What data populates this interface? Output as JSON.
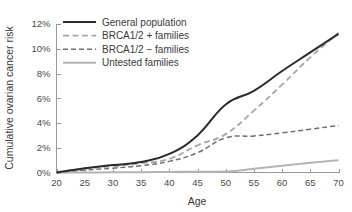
{
  "chart_data": {
    "type": "line",
    "title": "",
    "xlabel": "Age",
    "ylabel": "Cumulative ovarian cancer risk",
    "xlim": [
      20,
      70
    ],
    "ylim": [
      0,
      12
    ],
    "grid": false,
    "legend_position": "top-left-inside",
    "x_tick_labels": [
      "20",
      "25",
      "30",
      "35",
      "40",
      "45",
      "50",
      "55",
      "60",
      "65",
      "70"
    ],
    "x_ticks": [
      20,
      25,
      30,
      35,
      40,
      45,
      50,
      55,
      60,
      65,
      70
    ],
    "y_tick_labels": [
      "0%",
      "2%",
      "4%",
      "6%",
      "8%",
      "10%",
      "12%"
    ],
    "y_ticks": [
      0,
      2,
      4,
      6,
      8,
      10,
      12
    ],
    "x": [
      20,
      25,
      30,
      35,
      40,
      45,
      50,
      55,
      60,
      65,
      70
    ],
    "series": [
      {
        "name": "General population",
        "color": "#2b2b2b",
        "style": "solid",
        "width": 2.0,
        "values": [
          0.0,
          0.35,
          0.6,
          0.85,
          1.5,
          3.0,
          5.5,
          6.6,
          8.2,
          9.7,
          11.2
        ]
      },
      {
        "name": "BRCA1/2 + families",
        "color": "#a8a8a8",
        "style": "dashed",
        "width": 1.9,
        "values": [
          0.0,
          0.3,
          0.5,
          0.75,
          1.1,
          2.2,
          3.1,
          5.0,
          7.1,
          9.3,
          11.3
        ]
      },
      {
        "name": "BRCA1/2 − families",
        "color": "#6e6e6e",
        "style": "dashed",
        "width": 1.5,
        "values": [
          0.0,
          0.2,
          0.35,
          0.55,
          0.9,
          1.6,
          2.8,
          2.95,
          3.2,
          3.5,
          3.8
        ]
      },
      {
        "name": "Untested families",
        "color": "#b4b4b4",
        "style": "solid",
        "width": 2.0,
        "values": [
          0.0,
          0.0,
          0.02,
          0.03,
          0.05,
          0.06,
          0.08,
          0.3,
          0.55,
          0.78,
          1.0
        ]
      }
    ]
  },
  "legend": {
    "items": [
      {
        "label": "General population"
      },
      {
        "label": "BRCA1/2 + families"
      },
      {
        "label": "BRCA1/2 − families"
      },
      {
        "label": "Untested families"
      }
    ]
  },
  "axes": {
    "x_title": "Age",
    "y_title": "Cumulative ovarian cancer risk"
  }
}
